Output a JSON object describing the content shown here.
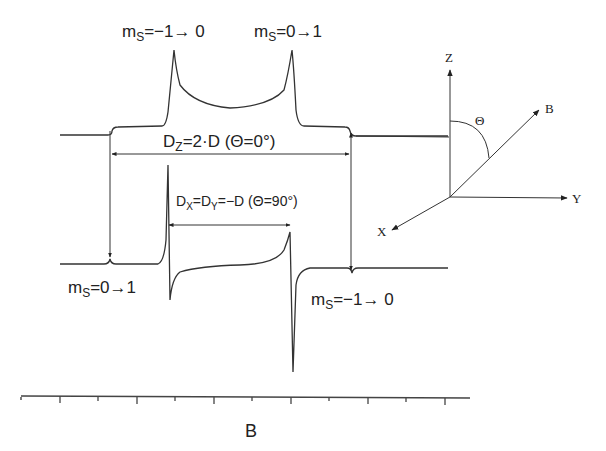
{
  "diagram": {
    "title": "",
    "top_spectrum": {
      "peak_labels": [
        {
          "ms": "m",
          "sub": "S",
          "rest": "=−1→ 0"
        },
        {
          "ms": "m",
          "sub": "S",
          "rest": "=0→1"
        }
      ],
      "dz_label": {
        "main": "D",
        "sub": "Z",
        "rest": "=2·D (Θ=0°)"
      }
    },
    "bottom_spectrum": {
      "dxdy_label": {
        "main": "D",
        "sub_x": "X",
        "mid": "=D",
        "sub_y": "Y",
        "rest": "=−D (Θ=90°)"
      },
      "left_label": {
        "ms": "m",
        "sub": "S",
        "rest": "=0→1"
      },
      "right_label": {
        "ms": "m",
        "sub": "S",
        "rest": "=−1→ 0"
      }
    },
    "field_axis": {
      "label": "B",
      "major_ticks": 6,
      "minor_ticks": 5
    },
    "coordinate_system": {
      "axes": {
        "z": "Z",
        "y": "Y",
        "x": "X",
        "b": "B"
      },
      "angle": "Θ"
    }
  }
}
